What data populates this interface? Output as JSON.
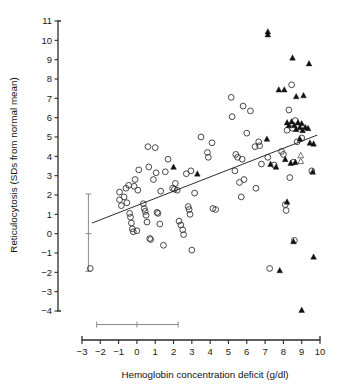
{
  "chart_data": {
    "type": "scatter",
    "title": "",
    "xlabel": "Hemoglobin concentration deficit (g/dl)",
    "ylabel": "Reticulocytosis (SDs from normal mean)",
    "xlim": [
      -3,
      10
    ],
    "ylim": [
      -4,
      11
    ],
    "xticks": [
      -3,
      -2,
      -1,
      0,
      1,
      2,
      3,
      4,
      5,
      6,
      7,
      8,
      9,
      10
    ],
    "xticklabels": [
      "−3",
      "−2",
      "−1",
      "0",
      "1",
      "2",
      "3",
      "4",
      "5",
      "6",
      "7",
      "8",
      "9",
      "10"
    ],
    "yticks": [
      -4,
      -3,
      -2,
      -1,
      0,
      1,
      2,
      3,
      4,
      5,
      6,
      7,
      8,
      9,
      10,
      11
    ],
    "yticklabels": [
      "−4",
      "−3",
      "−2",
      "−1",
      "0",
      "1",
      "2",
      "3",
      "4",
      "5",
      "6",
      "7",
      "8",
      "9",
      "10",
      "11"
    ],
    "grid": false,
    "legend": null,
    "regression_line": {
      "x_start": -2.45,
      "y_start": 0.55,
      "x_end": 9.85,
      "y_end": 5.1
    },
    "reference_bar_vertical": {
      "x": -2.65,
      "y_low": -1.95,
      "y_high": 2.05,
      "y_center": 0.0
    },
    "reference_bar_horizontal": {
      "y": -4.7,
      "x_low": -2.2,
      "x_high": 2.25,
      "x_center": 0.0
    },
    "series": [
      {
        "name": "open-circle",
        "marker": "circle-open",
        "points": [
          [
            -2.55,
            -1.8
          ],
          [
            -0.95,
            2.15
          ],
          [
            -0.95,
            1.75
          ],
          [
            -0.85,
            1.45
          ],
          [
            -0.7,
            1.9
          ],
          [
            -0.6,
            2.35
          ],
          [
            -0.55,
            1.6
          ],
          [
            -0.45,
            2.5
          ],
          [
            -0.4,
            1.05
          ],
          [
            -0.35,
            0.85
          ],
          [
            -0.3,
            0.55
          ],
          [
            -0.25,
            0.25
          ],
          [
            -0.2,
            0.1
          ],
          [
            -0.15,
            2.45
          ],
          [
            -0.1,
            2.8
          ],
          [
            0.0,
            0.15
          ],
          [
            0.05,
            2.25
          ],
          [
            0.1,
            3.3
          ],
          [
            0.35,
            1.55
          ],
          [
            0.4,
            1.3
          ],
          [
            0.45,
            1.15
          ],
          [
            0.5,
            0.95
          ],
          [
            0.55,
            0.6
          ],
          [
            0.6,
            4.5
          ],
          [
            0.65,
            3.45
          ],
          [
            0.7,
            -0.25
          ],
          [
            0.75,
            -0.3
          ],
          [
            0.9,
            2.8
          ],
          [
            1.0,
            4.45
          ],
          [
            1.05,
            3.15
          ],
          [
            1.1,
            1.1
          ],
          [
            1.15,
            1.05
          ],
          [
            1.25,
            0.5
          ],
          [
            1.3,
            2.2
          ],
          [
            1.45,
            -0.6
          ],
          [
            1.55,
            3.2
          ],
          [
            1.7,
            3.85
          ],
          [
            1.95,
            2.35
          ],
          [
            2.05,
            2.3
          ],
          [
            2.1,
            2.6
          ],
          [
            2.2,
            2.25
          ],
          [
            2.3,
            0.65
          ],
          [
            2.4,
            0.45
          ],
          [
            2.5,
            0.2
          ],
          [
            2.55,
            -0.05
          ],
          [
            2.7,
            3.1
          ],
          [
            2.8,
            1.4
          ],
          [
            2.85,
            1.25
          ],
          [
            2.9,
            1.0
          ],
          [
            2.95,
            3.25
          ],
          [
            3.0,
            -0.85
          ],
          [
            3.15,
            2.1
          ],
          [
            3.5,
            5.0
          ],
          [
            3.85,
            4.2
          ],
          [
            3.9,
            3.95
          ],
          [
            4.1,
            4.7
          ],
          [
            4.15,
            1.3
          ],
          [
            4.3,
            1.25
          ],
          [
            5.15,
            7.05
          ],
          [
            5.2,
            6.05
          ],
          [
            5.35,
            3.25
          ],
          [
            5.4,
            4.1
          ],
          [
            5.5,
            3.95
          ],
          [
            5.6,
            2.65
          ],
          [
            5.7,
            1.9
          ],
          [
            5.75,
            3.85
          ],
          [
            5.8,
            6.6
          ],
          [
            5.85,
            2.8
          ],
          [
            6.0,
            5.2
          ],
          [
            6.2,
            6.35
          ],
          [
            6.45,
            4.5
          ],
          [
            6.5,
            2.35
          ],
          [
            6.65,
            4.75
          ],
          [
            6.7,
            4.55
          ],
          [
            6.8,
            3.6
          ],
          [
            7.15,
            3.95
          ],
          [
            7.25,
            -1.8
          ],
          [
            7.5,
            3.55
          ],
          [
            7.9,
            4.25
          ],
          [
            8.0,
            4.1
          ],
          [
            8.1,
            1.5
          ],
          [
            8.15,
            1.2
          ],
          [
            8.2,
            5.35
          ],
          [
            8.3,
            6.4
          ],
          [
            8.35,
            2.9
          ],
          [
            8.45,
            7.7
          ],
          [
            8.5,
            5.45
          ],
          [
            8.55,
            3.7
          ],
          [
            8.6,
            -0.35
          ],
          [
            8.65,
            5.85
          ],
          [
            8.75,
            4.75
          ],
          [
            9.0,
            4.95
          ],
          [
            9.55,
            3.25
          ]
        ]
      },
      {
        "name": "filled-triangle",
        "marker": "triangle-filled",
        "points": [
          [
            7.15,
            10.45
          ],
          [
            7.15,
            10.3
          ],
          [
            8.5,
            9.1
          ],
          [
            9.4,
            8.8
          ],
          [
            7.75,
            7.45
          ],
          [
            8.05,
            7.45
          ],
          [
            8.7,
            7.1
          ],
          [
            9.1,
            7.15
          ],
          [
            8.2,
            5.75
          ],
          [
            8.3,
            5.6
          ],
          [
            8.45,
            5.8
          ],
          [
            8.6,
            5.6
          ],
          [
            8.7,
            5.4
          ],
          [
            8.8,
            5.75
          ],
          [
            8.9,
            5.5
          ],
          [
            9.0,
            5.7
          ],
          [
            9.05,
            5.35
          ],
          [
            9.2,
            5.5
          ],
          [
            9.35,
            5.45
          ],
          [
            7.1,
            4.9
          ],
          [
            8.9,
            4.9
          ],
          [
            9.45,
            4.7
          ],
          [
            9.65,
            4.65
          ],
          [
            2.0,
            3.45
          ],
          [
            3.3,
            3.1
          ],
          [
            7.3,
            3.6
          ],
          [
            7.6,
            3.45
          ],
          [
            8.1,
            3.85
          ],
          [
            8.4,
            3.65
          ],
          [
            8.65,
            3.7
          ],
          [
            9.6,
            3.2
          ],
          [
            8.2,
            1.65
          ],
          [
            8.55,
            -0.4
          ],
          [
            9.65,
            -1.2
          ],
          [
            7.8,
            -1.9
          ],
          [
            9.0,
            -3.95
          ]
        ]
      },
      {
        "name": "open-triangle",
        "marker": "triangle-open",
        "points": [
          [
            8.95,
            4.05
          ],
          [
            8.95,
            3.75
          ]
        ]
      }
    ]
  }
}
